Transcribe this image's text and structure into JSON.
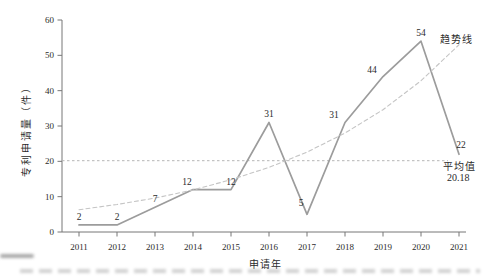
{
  "chart_data": {
    "type": "line",
    "title": "",
    "xlabel": "申请年",
    "ylabel": "专利申请量（件）",
    "x": [
      2011,
      2012,
      2013,
      2014,
      2015,
      2016,
      2017,
      2018,
      2019,
      2020,
      2021
    ],
    "series": [
      {
        "name": "专利申请量",
        "values": [
          2,
          2,
          7,
          12,
          12,
          31,
          5,
          31,
          44,
          54,
          22
        ],
        "color": "#9c9c9c",
        "style": "solid",
        "point_labels": true
      },
      {
        "name": "趋势线",
        "values": [
          6.3,
          7.8,
          9.6,
          11.9,
          14.8,
          18.3,
          22.6,
          28.0,
          34.6,
          42.8,
          53.0
        ],
        "color": "#c5c5c5",
        "style": "dashed",
        "point_labels": false
      }
    ],
    "average_line": {
      "value": 20.18,
      "label": "平均值",
      "value_label": "20.18",
      "color": "#b5b5b5"
    },
    "ylim": [
      0,
      60
    ],
    "yticks": [
      0,
      10,
      20,
      30,
      40,
      50,
      60
    ],
    "grid": false,
    "legend_position": "inline-annotations",
    "colors": {
      "axis": "#777777",
      "text": "#2b2b2b",
      "data_line": "#9c9c9c",
      "trend_line": "#c5c5c5",
      "average_line": "#b5b5b5"
    }
  }
}
